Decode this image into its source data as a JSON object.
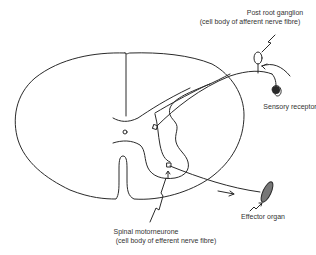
{
  "diagram": {
    "type": "reflex-arc",
    "labels": {
      "ganglion_title": "Post root ganglion",
      "ganglion_sub": "(cell body of afferent nerve fibre)",
      "sensory": "Sensory receptor",
      "effector": "Effector organ",
      "motor_title": "Spinal motorneurone",
      "motor_sub": "(cell body of efferent nerve fibre)"
    },
    "colors": {
      "line": "#2a2a2a",
      "text": "#333333",
      "background": "#ffffff"
    }
  }
}
